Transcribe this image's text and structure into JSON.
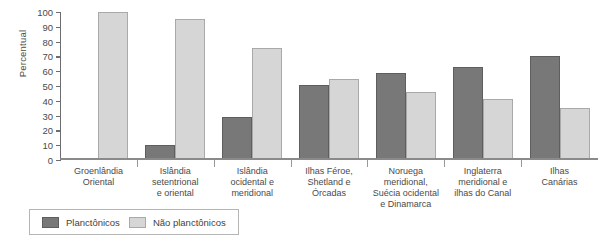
{
  "chart_data": {
    "type": "bar",
    "title": "",
    "xlabel": "",
    "ylabel": "Percentual",
    "ylim": [
      0,
      100
    ],
    "yticks": [
      0,
      10,
      20,
      30,
      40,
      50,
      60,
      70,
      80,
      90,
      100
    ],
    "grid": false,
    "legend_position": "bottom-left",
    "categories": [
      "Groenlândia Oriental",
      "Islândia setentrional e oriental",
      "Islândia ocidental e meridional",
      "Ilhas Féroe, Shetland e Órcadas",
      "Noruega meridional, Suécia ocidental e Dinamarca",
      "Inglaterra meridional e ilhas do Canal",
      "Ilhas Canárias"
    ],
    "category_lines": [
      [
        "Groenlândia",
        "Oriental"
      ],
      [
        "Islândia",
        "setentrional",
        "e oriental"
      ],
      [
        "Islândia",
        "ocidental e",
        "meridional"
      ],
      [
        "Ilhas Féroe,",
        "Shetland e",
        "Órcadas"
      ],
      [
        "Noruega",
        "meridional,",
        "Suécia ocidental",
        "e Dinamarca"
      ],
      [
        "Inglaterra",
        "meridional e",
        "ilhas do Canal"
      ],
      [
        "Ilhas",
        "Canárias"
      ]
    ],
    "series": [
      {
        "name": "Planctônicos",
        "color": "#787878",
        "values": [
          0,
          10,
          29,
          51,
          59,
          63,
          70
        ]
      },
      {
        "name": "Não planctônicos",
        "color": "#d6d6d6",
        "values": [
          100,
          95,
          76,
          55,
          46,
          41,
          35
        ]
      }
    ]
  },
  "legend": {
    "items": [
      {
        "label": "Planctônicos",
        "swatch": "dark"
      },
      {
        "label": "Não planctônicos",
        "swatch": "light"
      }
    ]
  },
  "colors": {
    "dark": "#787878",
    "light": "#d6d6d6",
    "axis": "#6d6d6d",
    "text": "#4a4a4a"
  }
}
